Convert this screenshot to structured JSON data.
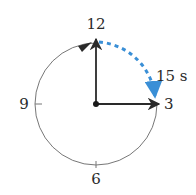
{
  "diagram": {
    "type": "clock-face",
    "hour_labels": {
      "top": "12",
      "right": "3",
      "bottom": "6",
      "left": "9"
    },
    "elapsed_label": "15 s",
    "hands": [
      {
        "name": "start-hand",
        "points_to": "12"
      },
      {
        "name": "end-hand",
        "points_to": "3"
      }
    ],
    "arc_color": "#3a8fd6",
    "line_color": "#2a2a2a",
    "circle_color": "#777777"
  }
}
